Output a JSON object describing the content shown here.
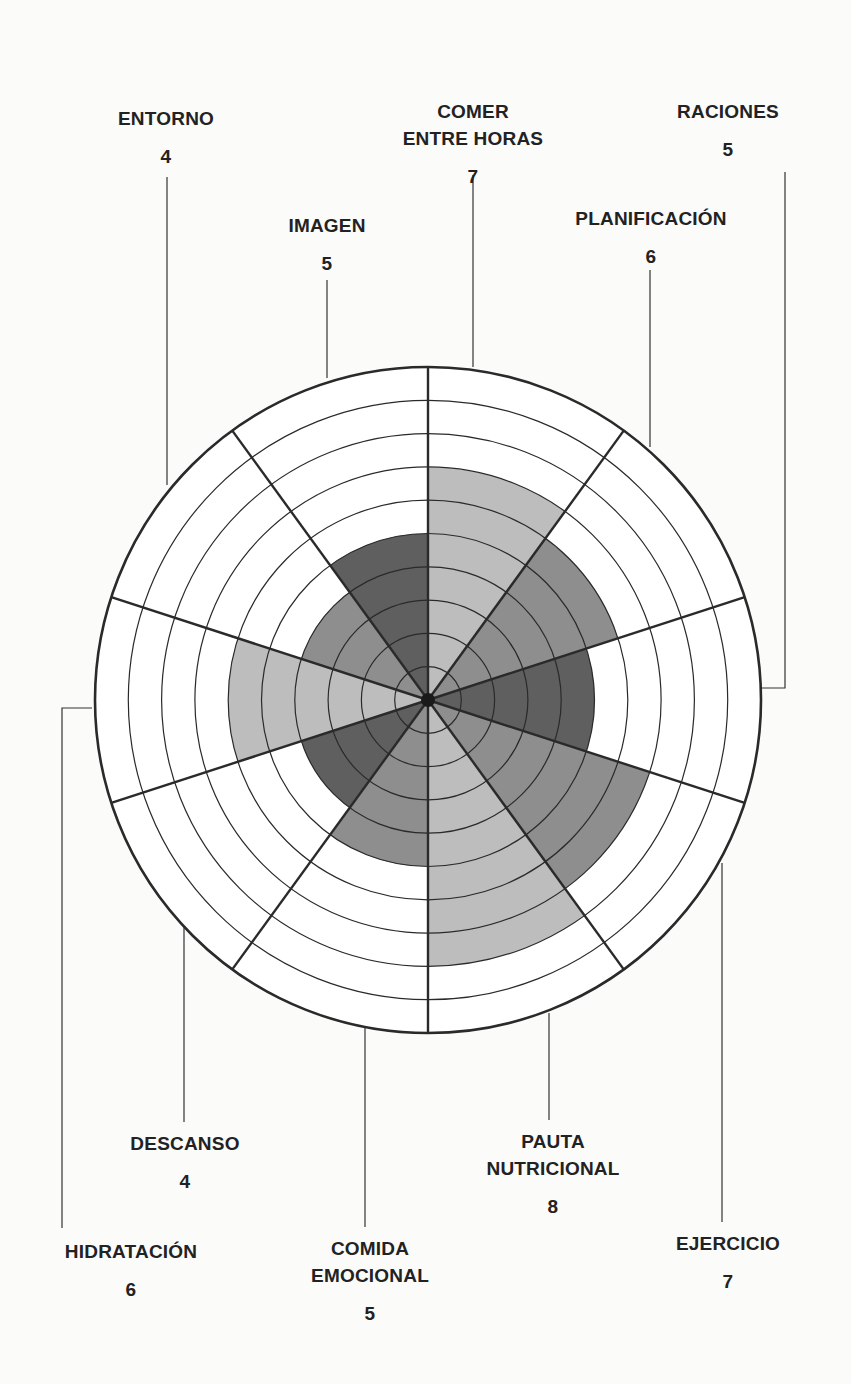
{
  "chart_data": {
    "type": "polar-area",
    "title": "",
    "scale_max": 10,
    "rings": 10,
    "center": [
      428,
      700
    ],
    "outer_radius": 333,
    "start_angle_deg": 0,
    "direction": "clockwise",
    "colors": {
      "light": "#bdbdbd",
      "medium": "#8e8e8e",
      "dark": "#5f5f5f",
      "grid": "#2a2a2a",
      "background": "#ffffff"
    },
    "categories": [
      "COMER ENTRE HORAS",
      "PLANIFICACIÓN",
      "RACIONES",
      "EJERCICIO",
      "PAUTA NUTRICIONAL",
      "COMIDA EMOCIONAL",
      "DESCANSO",
      "HIDRATACIÓN",
      "ENTORNO",
      "IMAGEN"
    ],
    "values": [
      7,
      6,
      5,
      7,
      8,
      5,
      4,
      6,
      4,
      5
    ],
    "shades": [
      "light",
      "medium",
      "dark",
      "medium",
      "light",
      "medium",
      "dark",
      "light",
      "medium",
      "dark"
    ]
  },
  "labels": [
    {
      "id": "comer-entre-horas",
      "lines": [
        "COMER",
        "ENTRE HORAS"
      ],
      "score": "7",
      "x": 473,
      "y": 98,
      "leader": [
        [
          473,
          175
        ],
        [
          473,
          367
        ]
      ]
    },
    {
      "id": "planificacion",
      "lines": [
        "PLANIFICACIÓN"
      ],
      "score": "6",
      "x": 651,
      "y": 205,
      "leader": [
        [
          650,
          270
        ],
        [
          650,
          447
        ]
      ]
    },
    {
      "id": "raciones",
      "lines": [
        "RACIONES"
      ],
      "score": "5",
      "x": 728,
      "y": 98,
      "leader": [
        [
          785,
          172
        ],
        [
          785,
          688
        ],
        [
          762,
          688
        ]
      ]
    },
    {
      "id": "ejercicio",
      "lines": [
        "EJERCICIO"
      ],
      "score": "7",
      "x": 728,
      "y": 1230,
      "leader": [
        [
          722,
          863
        ],
        [
          722,
          1222
        ]
      ]
    },
    {
      "id": "pauta-nutricional",
      "lines": [
        "PAUTA",
        "NUTRICIONAL"
      ],
      "score": "8",
      "x": 553,
      "y": 1128,
      "leader": [
        [
          549,
          1013
        ],
        [
          549,
          1120
        ]
      ]
    },
    {
      "id": "comida-emocional",
      "lines": [
        "COMIDA",
        "EMOCIONAL"
      ],
      "score": "5",
      "x": 370,
      "y": 1235,
      "leader": [
        [
          365,
          1025
        ],
        [
          365,
          1227
        ]
      ]
    },
    {
      "id": "descanso",
      "lines": [
        "DESCANSO"
      ],
      "score": "4",
      "x": 185,
      "y": 1130,
      "leader": [
        [
          184,
          910
        ],
        [
          184,
          1122
        ]
      ]
    },
    {
      "id": "hidratacion",
      "lines": [
        "HIDRATACIÓN"
      ],
      "score": "6",
      "x": 131,
      "y": 1238,
      "leader": [
        [
          92,
          708
        ],
        [
          62,
          708
        ],
        [
          62,
          1228
        ]
      ]
    },
    {
      "id": "entorno",
      "lines": [
        "ENTORNO"
      ],
      "score": "4",
      "x": 166,
      "y": 105,
      "leader": [
        [
          167,
          177
        ],
        [
          167,
          485
        ]
      ]
    },
    {
      "id": "imagen",
      "lines": [
        "IMAGEN"
      ],
      "score": "5",
      "x": 327,
      "y": 212,
      "leader": [
        [
          327,
          280
        ],
        [
          327,
          378
        ]
      ]
    }
  ]
}
